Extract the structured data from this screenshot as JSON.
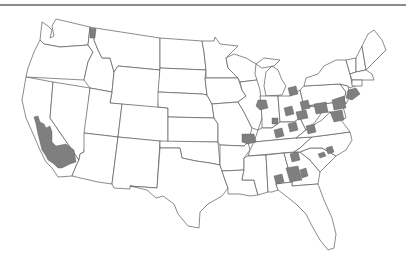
{
  "caption": "",
  "map": {
    "title": "",
    "projection": "US Lower 48 (Albers-like)",
    "colors": {
      "background": "#ffffff",
      "state_fill": "#ffffff",
      "state_border": "#5a5a5a",
      "highlight_fill": "#7f7f7f",
      "rule": "#8a8a8a"
    },
    "highlighted_areas": [
      {
        "id": "ca-central-valley",
        "state": "California",
        "label": "Central California"
      },
      {
        "id": "id-panhandle",
        "state": "Idaho",
        "label": "Northern Idaho"
      },
      {
        "id": "il-peoria",
        "state": "Illinois",
        "label": "Central Illinois"
      },
      {
        "id": "il-stlouis",
        "state": "Illinois",
        "label": "Southwest Illinois"
      },
      {
        "id": "in-central",
        "state": "Indiana",
        "label": "Indiana counties"
      },
      {
        "id": "mi-detroit",
        "state": "Michigan",
        "label": "Southeast Michigan"
      },
      {
        "id": "oh-counties",
        "state": "Ohio",
        "label": "Ohio counties"
      },
      {
        "id": "ky-counties",
        "state": "Kentucky",
        "label": "Northern Kentucky"
      },
      {
        "id": "wv-counties",
        "state": "West Virginia",
        "label": "West Virginia counties"
      },
      {
        "id": "pa-counties",
        "state": "Pennsylvania",
        "label": "Pennsylvania counties"
      },
      {
        "id": "nj-ny-metro",
        "state": "New Jersey",
        "label": "NY/NJ metro"
      },
      {
        "id": "md-va-dc",
        "state": "Maryland",
        "label": "Baltimore-Washington"
      },
      {
        "id": "nc-counties",
        "state": "North Carolina",
        "label": "North Carolina counties"
      },
      {
        "id": "tn-counties",
        "state": "Tennessee",
        "label": "Southeast Tennessee"
      },
      {
        "id": "al-counties",
        "state": "Alabama",
        "label": "Central Alabama"
      },
      {
        "id": "ga-west",
        "state": "Georgia",
        "label": "West Georgia"
      }
    ]
  }
}
